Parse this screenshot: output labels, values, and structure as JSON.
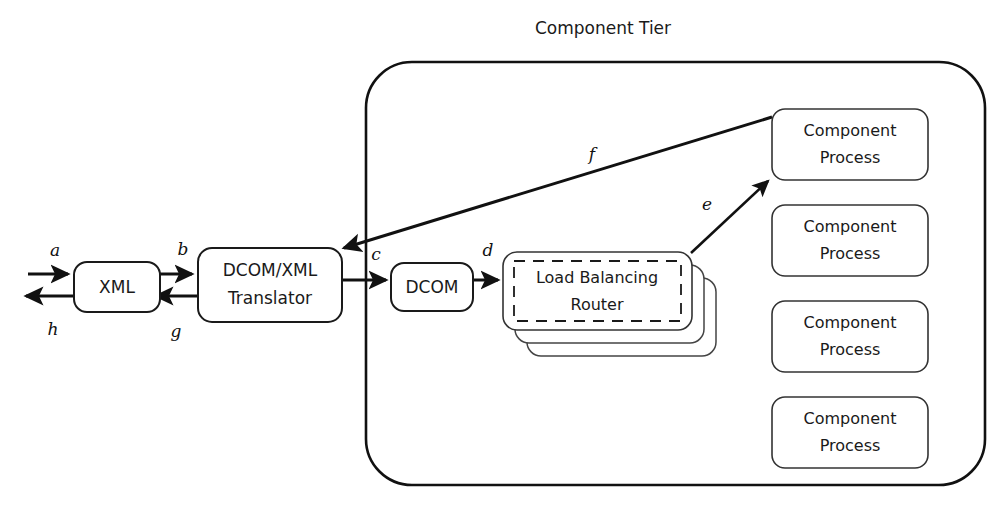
{
  "diagram": {
    "title": "Component Tier",
    "nodes": {
      "xml": {
        "label": "XML"
      },
      "translator": {
        "line1": "DCOM/XML",
        "line2": "Translator"
      },
      "dcom": {
        "label": "DCOM"
      },
      "router": {
        "line1": "Load Balancing",
        "line2": "Router"
      },
      "process1": {
        "line1": "Component",
        "line2": "Process"
      },
      "process2": {
        "line1": "Component",
        "line2": "Process"
      },
      "process3": {
        "line1": "Component",
        "line2": "Process"
      },
      "process4": {
        "line1": "Component",
        "line2": "Process"
      }
    },
    "edge_labels": {
      "a": "a",
      "b": "b",
      "c": "c",
      "d": "d",
      "e": "e",
      "f": "f",
      "g": "g",
      "h": "h"
    },
    "colors": {
      "stroke": "#111111",
      "text": "#1a1a1a",
      "background": "#ffffff"
    }
  }
}
